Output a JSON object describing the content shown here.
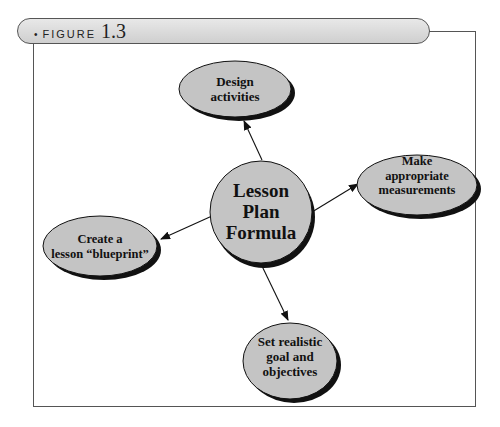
{
  "figure": {
    "bullet": "•",
    "label": "FIGURE",
    "number": "1.3"
  },
  "diagram": {
    "center": {
      "lines": [
        "Lesson",
        "Plan",
        "Formula"
      ]
    },
    "nodes": [
      {
        "id": "design",
        "lines": [
          "Design",
          "activities"
        ]
      },
      {
        "id": "measure",
        "lines": [
          "Make",
          "appropriate",
          "measurements"
        ]
      },
      {
        "id": "blueprint",
        "lines": [
          "Create a",
          "lesson “blueprint”"
        ]
      },
      {
        "id": "goal",
        "lines": [
          "Set realistic",
          "goal and",
          "objectives"
        ]
      }
    ]
  },
  "colors": {
    "node_fill": "#c4c4c4",
    "outline": "#111111",
    "frame": "#555555"
  }
}
